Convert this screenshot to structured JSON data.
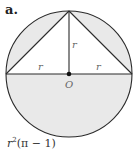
{
  "figure": {
    "label": "a.",
    "labels": {
      "vertical_radius": "r",
      "left_radius": "r",
      "right_radius": "r",
      "center": "O"
    },
    "caption": {
      "base": "r",
      "exponent": "2",
      "expression": "(π − 1)"
    },
    "colors": {
      "stroke": "#2a2a2a",
      "shade": "#e8e8e8",
      "label": "#666666"
    }
  }
}
